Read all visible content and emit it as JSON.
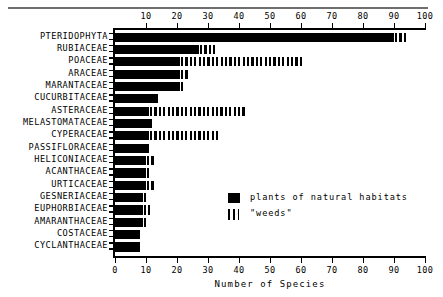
{
  "chart_data": {
    "type": "bar",
    "orientation": "horizontal",
    "title": "",
    "xlabel": "Number of Species",
    "ylabel": "",
    "xlim": [
      0,
      100
    ],
    "xticks": [
      0,
      10,
      20,
      30,
      40,
      50,
      60,
      70,
      80,
      90,
      100
    ],
    "xticklabels_top": [
      "10",
      "20",
      "30",
      "40",
      "50",
      "60",
      "70",
      "80",
      "90",
      "100"
    ],
    "xticklabels_bottom": [
      "0",
      "10",
      "20",
      "30",
      "40",
      "50",
      "60",
      "70",
      "80",
      "90",
      "100"
    ],
    "grid": false,
    "legend_position": "center-right",
    "categories": [
      "PTERIDOPHYTA",
      "RUBIACEAE",
      "POACEAE",
      "ARACEAE",
      "MARANTACEAE",
      "CUCURBITACEAE",
      "ASTERACEAE",
      "MELASTOMATACEAE",
      "CYPERACEAE",
      "PASSIFLORACEAE",
      "HELICONIACEAE",
      "ACANTHACEAE",
      "URTICACEAE",
      "GESNERIACEAE",
      "EUPHORBIACEAE",
      "AMARANTHACEAE",
      "COSTACEAE",
      "CYCLANTHACEAE"
    ],
    "series": [
      {
        "name": "plants of natural habitats",
        "pattern": "solid",
        "color": "#000000",
        "values": [
          90,
          27,
          21,
          21,
          21,
          14,
          11,
          12,
          11,
          11,
          10,
          10,
          10,
          9,
          9,
          9,
          8,
          8
        ]
      },
      {
        "name": "\"weeds\"",
        "pattern": "hatched",
        "color": "#000000",
        "values": [
          4,
          5,
          39,
          3,
          1,
          0,
          31,
          0,
          22,
          0,
          3,
          1,
          3,
          1,
          2,
          1,
          0,
          0
        ]
      }
    ],
    "totals": [
      94,
      32,
      60,
      24,
      22,
      14,
      42,
      12,
      33,
      11,
      13,
      11,
      13,
      10,
      11,
      10,
      8,
      8
    ]
  },
  "legend": {
    "items": [
      {
        "label": "plants of natural habitats",
        "swatch": "solid"
      },
      {
        "label": "\"weeds\"",
        "swatch": "hatched"
      }
    ]
  }
}
